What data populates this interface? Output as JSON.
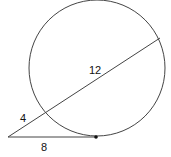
{
  "diagram": {
    "type": "geometry-secant-tangent",
    "labels": {
      "secant_external": "4",
      "secant_internal": "12",
      "tangent": "8"
    },
    "colors": {
      "stroke": "#444444",
      "text": "#111111"
    }
  }
}
